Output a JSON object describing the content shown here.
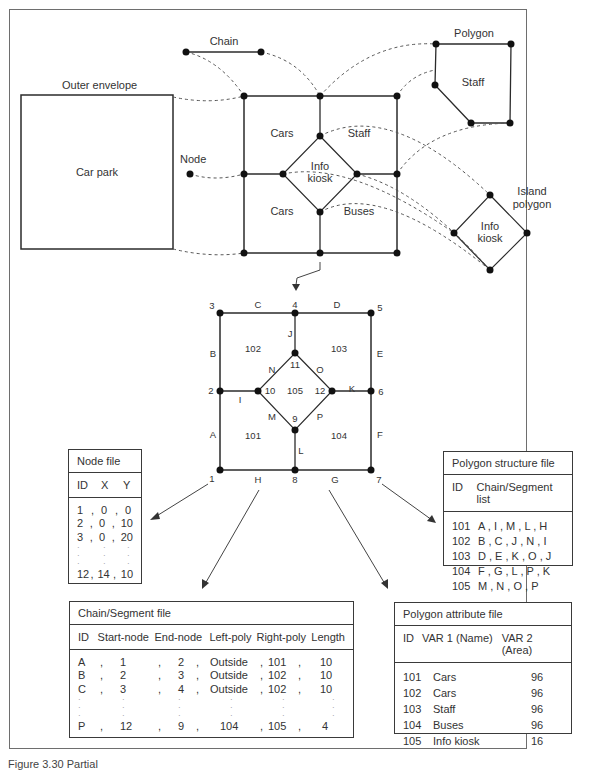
{
  "top_diagram": {
    "labels": {
      "chain": "Chain",
      "polygon": "Polygon",
      "outer_envelope": "Outer envelope",
      "car_park": "Car park",
      "node": "Node",
      "cars_upper": "Cars",
      "cars_lower": "Cars",
      "staff_center": "Staff",
      "buses": "Buses",
      "info_center": "Info",
      "kiosk_center": "kiosk",
      "staff_polygon": "Staff",
      "island": "Island",
      "island_polygon": "polygon",
      "info_island": "Info",
      "kiosk_island": "kiosk"
    }
  },
  "topology_diagram": {
    "nodes": [
      "1",
      "2",
      "3",
      "4",
      "5",
      "6",
      "7",
      "8",
      "9",
      "10",
      "11",
      "12"
    ],
    "segments": [
      "A",
      "B",
      "C",
      "D",
      "E",
      "F",
      "G",
      "H",
      "I",
      "J",
      "K",
      "L",
      "M",
      "N",
      "O",
      "P"
    ],
    "polygons": [
      "101",
      "102",
      "103",
      "104",
      "105"
    ]
  },
  "node_file": {
    "title": "Node file",
    "headers": [
      "ID",
      "X",
      "Y"
    ],
    "rows": [
      [
        "1",
        "0",
        "0"
      ],
      [
        "2",
        "0",
        "10"
      ],
      [
        "3",
        "0",
        "20"
      ],
      [
        "12",
        "14",
        "10"
      ]
    ]
  },
  "polygon_structure_file": {
    "title": "Polygon structure file",
    "headers": [
      "ID",
      "Chain/Segment list"
    ],
    "rows": [
      [
        "101",
        "A , I , M , L , H"
      ],
      [
        "102",
        "B , C , J , N , I"
      ],
      [
        "103",
        "D , E , K , O , J"
      ],
      [
        "104",
        "F , G , L , P , K"
      ],
      [
        "105",
        "M , N , O , P"
      ]
    ]
  },
  "chain_segment_file": {
    "title": "Chain/Segment file",
    "headers": [
      "ID",
      "Start-node",
      "End-node",
      "Left-poly",
      "Right-poly",
      "Length"
    ],
    "rows": [
      [
        "A",
        "1",
        "2",
        "Outside",
        "101",
        "10"
      ],
      [
        "B",
        "2",
        "3",
        "Outside",
        "102",
        "10"
      ],
      [
        "C",
        "3",
        "4",
        "Outside",
        "102",
        "10"
      ],
      [
        "P",
        "12",
        "9",
        "104",
        "105",
        "4"
      ]
    ]
  },
  "polygon_attribute_file": {
    "title": "Polygon attribute file",
    "headers": [
      "ID",
      "VAR 1 (Name)",
      "VAR 2 (Area)"
    ],
    "rows": [
      [
        "101",
        "Cars",
        "96"
      ],
      [
        "102",
        "Cars",
        "96"
      ],
      [
        "103",
        "Staff",
        "96"
      ],
      [
        "104",
        "Buses",
        "96"
      ],
      [
        "105",
        "Info kiosk",
        "16"
      ]
    ]
  },
  "caption": "Figure 3.30 Partial"
}
